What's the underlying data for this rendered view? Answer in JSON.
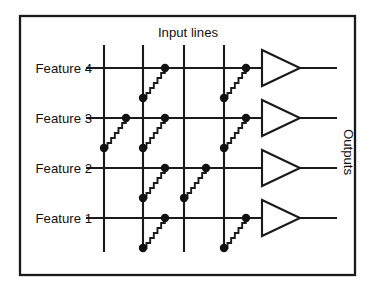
{
  "diagram": {
    "title": "Input lines",
    "outputs_label": "Outputs",
    "frame": {
      "x": 20,
      "y": 16,
      "width": 335,
      "height": 259
    },
    "title_position": {
      "x": 188,
      "y": 37
    },
    "outputs_position": {
      "x": 344,
      "y": 152
    },
    "colors": {
      "line": "#1a1a1a",
      "dot": "#111111",
      "amplifier_fill": "#ffffff",
      "background": "#ffffff",
      "text": "#111111"
    },
    "input_lines": {
      "count": 4,
      "x_positions": [
        104,
        143,
        184,
        224
      ],
      "y_top": 45,
      "y_bottom": 252
    },
    "rows": [
      {
        "label": "Feature 4",
        "y": 68,
        "label_x": 92,
        "wire_x_start": 86,
        "wire_x_end": 262,
        "output_x_end": 337,
        "connections": [
          1,
          3
        ]
      },
      {
        "label": "Feature 3",
        "y": 118,
        "label_x": 92,
        "wire_x_start": 86,
        "wire_x_end": 262,
        "output_x_end": 337,
        "connections": [
          0,
          1,
          3
        ]
      },
      {
        "label": "Feature 2",
        "y": 168,
        "label_x": 92,
        "wire_x_start": 86,
        "wire_x_end": 262,
        "output_x_end": 337,
        "connections": [
          1,
          2
        ]
      },
      {
        "label": "Feature 1",
        "y": 218,
        "label_x": 92,
        "wire_x_start": 86,
        "wire_x_end": 262,
        "output_x_end": 337,
        "connections": [
          1,
          3
        ]
      }
    ],
    "amplifier": {
      "x_left": 262,
      "x_tip": 300,
      "half_height": 18,
      "count": 4
    },
    "resistor": {
      "dx": 22,
      "dy": 30,
      "teeth": 6,
      "dot_radius": 4.2,
      "description": "zigzag resistor rising from input line to feature row"
    }
  }
}
